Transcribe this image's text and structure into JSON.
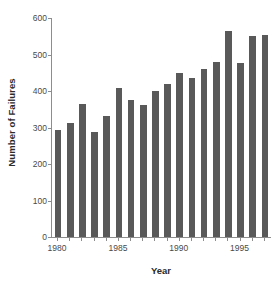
{
  "chart_data": {
    "type": "bar",
    "title": "",
    "xlabel": "Year",
    "ylabel": "Number of Failures",
    "categories": [
      1980,
      1981,
      1982,
      1983,
      1984,
      1985,
      1986,
      1987,
      1988,
      1989,
      1990,
      1991,
      1992,
      1993,
      1994,
      1995,
      1996,
      1997
    ],
    "values": [
      293,
      313,
      365,
      289,
      331,
      408,
      375,
      362,
      400,
      418,
      450,
      436,
      459,
      479,
      565,
      478,
      552,
      553
    ],
    "ylim": [
      0,
      600
    ],
    "y_ticks": [
      0,
      100,
      200,
      300,
      400,
      500,
      600
    ],
    "y_tick_labels": [
      "0",
      "100",
      "200",
      "300",
      "400",
      "500",
      "600"
    ],
    "x_tick_labels": [
      "1980",
      "1985",
      "1990",
      "1995"
    ],
    "x_tick_years": [
      1980,
      1985,
      1990,
      1995
    ],
    "grid": false,
    "legend": null,
    "bar_color": "#595959",
    "axis_color": "#8d8d8d",
    "background_color": "#ffffff"
  }
}
